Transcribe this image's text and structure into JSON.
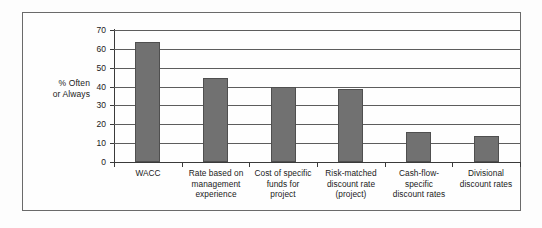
{
  "chart_data": {
    "type": "bar",
    "title": "",
    "subtitle": "",
    "xlabel": "",
    "ylabel": "% Often or Always",
    "ylabel_lines": [
      "% Often",
      "or Always"
    ],
    "categories": [
      "WACC",
      "Rate based on management experience",
      "Cost of specific funds for project",
      "Risk-matched discount rate (project)",
      "Cash-flow-specific discount rates",
      "Divisional discount rates"
    ],
    "category_lines": [
      [
        "WACC"
      ],
      [
        "Rate based on",
        "management",
        "experience"
      ],
      [
        "Cost of specific",
        "funds for",
        "project"
      ],
      [
        "Risk-matched",
        "discount rate",
        "(project)"
      ],
      [
        "Cash-flow-",
        "specific",
        "discount rates"
      ],
      [
        "Divisional",
        "discount rates"
      ]
    ],
    "values": [
      63.5,
      44.5,
      40,
      38.5,
      16,
      14
    ],
    "ylim": [
      0,
      70
    ],
    "yticks": [
      0,
      10,
      20,
      30,
      40,
      50,
      60,
      70
    ],
    "ytick_labels": [
      "0",
      "10",
      "20",
      "30",
      "40",
      "50",
      "60",
      "70"
    ],
    "grid": true,
    "grid_axis": "y",
    "legend": false,
    "legend_position": "none",
    "bar_color": "#717171",
    "bar_edge_color": "#4f4f4f",
    "axis_color": "#3a3a3a",
    "grid_color": "#5d5d5d",
    "background_color": "#fefefe",
    "frame_color": "#6a6a6a"
  }
}
